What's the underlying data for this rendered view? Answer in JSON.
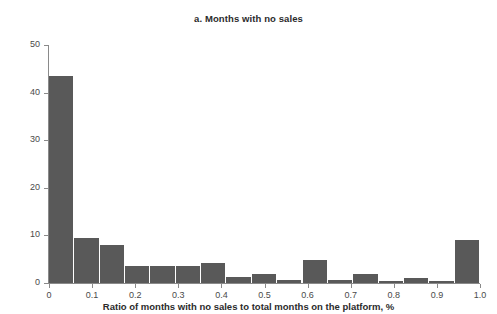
{
  "figure": {
    "clipped_top_title": "",
    "panel_title": "a. Months with no sales",
    "ylabel": "Firms, %",
    "xlabel": "Ratio of months with no sales to total months on the platform, %",
    "bar_color": "#595959",
    "axis_color": "#8a8a8a"
  },
  "chart_data": {
    "type": "bar",
    "title": "a. Months with no sales",
    "xlabel": "Ratio of months with no sales to total months on the platform, %",
    "ylabel": "Firms, %",
    "xlim": [
      0,
      1.0
    ],
    "ylim": [
      0,
      50
    ],
    "grid": false,
    "legend": false,
    "xticks": [
      "0",
      "0.1",
      "0.2",
      "0.3",
      "0.4",
      "0.5",
      "0.6",
      "0.7",
      "0.8",
      "0.9",
      "1.0"
    ],
    "xtick_values": [
      0,
      0.1,
      0.2,
      0.3,
      0.4,
      0.5,
      0.6,
      0.7,
      0.8,
      0.9,
      1.0
    ],
    "yticks": [
      "0",
      "10",
      "20",
      "30",
      "40",
      "50"
    ],
    "ytick_values": [
      0,
      10,
      20,
      30,
      40,
      50
    ],
    "bin_width": 0.0588,
    "bin_centers": [
      0.029,
      0.088,
      0.147,
      0.206,
      0.265,
      0.324,
      0.382,
      0.441,
      0.5,
      0.559,
      0.618,
      0.676,
      0.735,
      0.794,
      0.853,
      0.912,
      0.971
    ],
    "bin_starts": [
      0.0,
      0.0588,
      0.1176,
      0.1765,
      0.2353,
      0.2941,
      0.3529,
      0.4118,
      0.4706,
      0.5294,
      0.5882,
      0.6471,
      0.7059,
      0.7647,
      0.8235,
      0.8824,
      0.9412
    ],
    "values": [
      43.5,
      9.5,
      8.0,
      3.6,
      3.6,
      3.6,
      4.1,
      1.3,
      1.9,
      0.7,
      4.8,
      0.7,
      1.9,
      0.4,
      1.1,
      0.4,
      9.0
    ],
    "categories": [
      "0.00-0.06",
      "0.06-0.12",
      "0.12-0.18",
      "0.18-0.24",
      "0.24-0.29",
      "0.29-0.35",
      "0.35-0.41",
      "0.41-0.47",
      "0.47-0.53",
      "0.53-0.59",
      "0.59-0.65",
      "0.65-0.71",
      "0.71-0.76",
      "0.76-0.82",
      "0.82-0.88",
      "0.88-0.94",
      "0.94-1.00"
    ]
  }
}
